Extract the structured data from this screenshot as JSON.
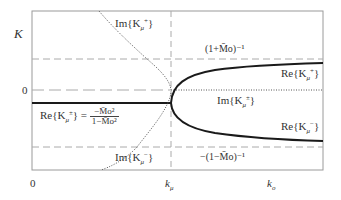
{
  "diagram": {
    "y_axis_label": "K",
    "y_zero_label": "0",
    "x_origin_label": "0",
    "x_tick_k_mu": "k",
    "x_tick_k_mu_sub": "μ",
    "x_tick_k_o": "k",
    "x_tick_k_o_sub": "o",
    "upper_asymptote_label": "(1+M̄o)⁻¹",
    "lower_asymptote_label": "−(1−M̄o)⁻¹",
    "labels": {
      "im_k_plus_top": "Im{K",
      "im_k_plus_top_sup": "+",
      "im_k_minus_bottom": "Im{K",
      "im_k_minus_bottom_sup": "−",
      "re_k_plus": "Re{K",
      "re_k_plus_sup": "+",
      "re_k_minus": "Re{K",
      "re_k_minus_sup": "−",
      "im_k_pm": "Im{K",
      "im_k_pm_sup": "±",
      "re_k_pm_left": "Re{K",
      "re_k_pm_left_sup": "±",
      "re_k_pm_num": "−M̄o²",
      "re_k_pm_den": "1−M̄o²",
      "mu": "μ",
      "close": "}"
    },
    "colors": {
      "frame": "#999999",
      "solid_curve": "#1a1a1a",
      "dashed": "#aaaaaa",
      "dotted": "#555555"
    }
  }
}
